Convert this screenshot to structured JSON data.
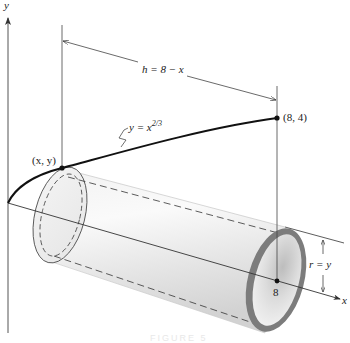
{
  "figure": {
    "type": "solid-of-revolution-shell-diagram",
    "axes": {
      "x_label": "x",
      "y_label": "y"
    },
    "curve": {
      "equation_lhs": "y",
      "equation_eq": " = ",
      "equation_base": "x",
      "equation_exp": "2/3",
      "color": "#111111"
    },
    "points": {
      "general_point": "(x, y)",
      "end_point": "(8, 4)",
      "x_tick": "8"
    },
    "dimensions": {
      "height_label": "h = 8 − x",
      "radius_label": "r = y"
    },
    "shell": {
      "body_color": "#e2e2e2",
      "ring_color": "#7c7c7c",
      "inner_color": "#d0d0d0"
    },
    "caption": "FIGURE 5"
  }
}
